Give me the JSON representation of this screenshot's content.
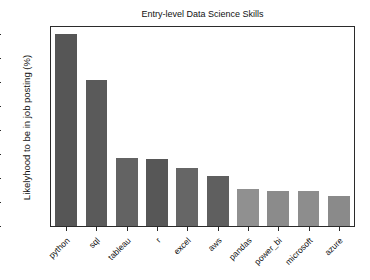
{
  "chart_data": {
    "type": "bar",
    "title": "Entry-level Data Science Skills",
    "xlabel": "",
    "ylabel": "Likelyhood to be in job posting (%)",
    "categories": [
      "python",
      "sql",
      "tableau",
      "r",
      "excel",
      "aws",
      "pandas",
      "power_bi",
      "microsoft",
      "azure"
    ],
    "values": [
      40.0,
      30.5,
      14.2,
      14.0,
      12.0,
      10.5,
      7.8,
      7.4,
      7.2,
      6.3
    ],
    "ylim": [
      0,
      41.5
    ],
    "yticks": [
      0,
      5,
      10,
      15,
      20,
      25,
      30,
      35,
      40
    ],
    "ytick_labels": [
      "0",
      "5",
      "10",
      "15",
      "20",
      "25",
      "30",
      "35",
      "40"
    ],
    "grid": false,
    "legend": null,
    "bar_colors": [
      "#565656",
      "#5a5a5a",
      "#636363",
      "#575757",
      "#666666",
      "#5f5f5f",
      "#909090",
      "#8b8b8b",
      "#8d8d8d",
      "#8a8a8a"
    ],
    "axis_color": "#2b2b2b",
    "background_color": "#ffffff",
    "tick_label_rotation": -45
  }
}
